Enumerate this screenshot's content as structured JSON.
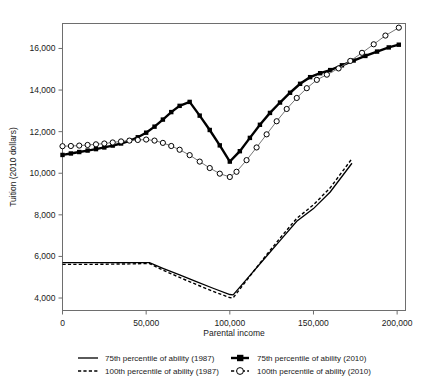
{
  "chart_data": {
    "type": "line",
    "title": "",
    "xlabel": "Parental income",
    "ylabel": "Tuition (2010 dollars)",
    "xlim": [
      0,
      205000
    ],
    "ylim": [
      3400,
      17200
    ],
    "xticks": [
      0,
      50000,
      100000,
      150000,
      200000
    ],
    "xtick_labels": [
      "0",
      "50,000",
      "100,000",
      "150,000",
      "200,000"
    ],
    "yticks": [
      4000,
      6000,
      8000,
      10000,
      12000,
      14000,
      16000
    ],
    "ytick_labels": [
      "4,000",
      "6,000",
      "8,000",
      "10,000",
      "12,000",
      "14,000",
      "16,000"
    ],
    "grid": false,
    "legend_position": "below",
    "series": [
      {
        "name": "75th percentile of ability (1987)",
        "style": "solid-line",
        "marker": "none",
        "color": "#000000",
        "x": [
          0,
          10000,
          20000,
          30000,
          40000,
          50000,
          52000,
          60000,
          70000,
          80000,
          90000,
          100000,
          102000,
          110000,
          120000,
          130000,
          140000,
          150000,
          160000,
          173000
        ],
        "y": [
          5700,
          5700,
          5700,
          5700,
          5700,
          5700,
          5700,
          5430,
          5110,
          4790,
          4470,
          4170,
          4150,
          4900,
          5830,
          6760,
          7690,
          8300,
          9100,
          10480
        ]
      },
      {
        "name": "100th percentile of ability (1987)",
        "style": "dashed-line",
        "marker": "none",
        "color": "#000000",
        "x": [
          0,
          10000,
          20000,
          30000,
          40000,
          50000,
          52000,
          60000,
          70000,
          80000,
          90000,
          100000,
          102000,
          110000,
          120000,
          130000,
          140000,
          150000,
          160000,
          173000
        ],
        "y": [
          5620,
          5620,
          5620,
          5630,
          5640,
          5660,
          5660,
          5340,
          4990,
          4650,
          4320,
          4020,
          4010,
          4850,
          5880,
          6880,
          7830,
          8480,
          9300,
          10700
        ]
      },
      {
        "name": "75th percentile of ability (2010)",
        "style": "marker-line",
        "marker": "filled-square",
        "color": "#000000",
        "x": [
          0,
          5000,
          10000,
          15000,
          20000,
          25000,
          30000,
          35000,
          40000,
          45000,
          50000,
          55000,
          60000,
          65000,
          70000,
          76000,
          82000,
          88000,
          94000,
          100000,
          106000,
          112000,
          118000,
          124000,
          130000,
          136000,
          142000,
          148000,
          154000,
          160000,
          167000,
          174000,
          181000,
          188000,
          195000,
          201000
        ],
        "y": [
          10880,
          10950,
          11020,
          11090,
          11160,
          11240,
          11330,
          11430,
          11560,
          11730,
          11950,
          12240,
          12580,
          12940,
          13240,
          13430,
          12770,
          12080,
          11340,
          10560,
          11060,
          11700,
          12330,
          12900,
          13400,
          13870,
          14300,
          14620,
          14810,
          14960,
          15190,
          15420,
          15640,
          15850,
          16050,
          16180
        ]
      },
      {
        "name": "100th percentile of ability (2010)",
        "style": "marker-line",
        "marker": "open-circle",
        "color": "#000000",
        "x": [
          0,
          5000,
          10000,
          15000,
          20000,
          25000,
          30000,
          35000,
          40000,
          45000,
          50000,
          55000,
          60000,
          65000,
          70000,
          76000,
          82000,
          88000,
          94000,
          100000,
          104000,
          110000,
          116000,
          122000,
          128000,
          134000,
          140000,
          146000,
          152000,
          158000,
          165000,
          172000,
          179000,
          186000,
          193000,
          201000
        ],
        "y": [
          11300,
          11310,
          11330,
          11360,
          11390,
          11430,
          11480,
          11530,
          11570,
          11600,
          11620,
          11570,
          11460,
          11310,
          11130,
          10870,
          10560,
          10250,
          9980,
          9820,
          10070,
          10630,
          11240,
          11870,
          12500,
          13090,
          13620,
          14090,
          14490,
          14740,
          15040,
          15400,
          15790,
          16200,
          16620,
          17000
        ]
      }
    ],
    "legend": [
      {
        "label": "75th percentile of ability (1987)",
        "marker": "solid-line"
      },
      {
        "label": "75th percentile of ability (2010)",
        "marker": "filled-square-line"
      },
      {
        "label": "100th percentile of ability (1987)",
        "marker": "dashed-line"
      },
      {
        "label": "100th percentile of ability (2010)",
        "marker": "open-circle-line"
      }
    ]
  }
}
